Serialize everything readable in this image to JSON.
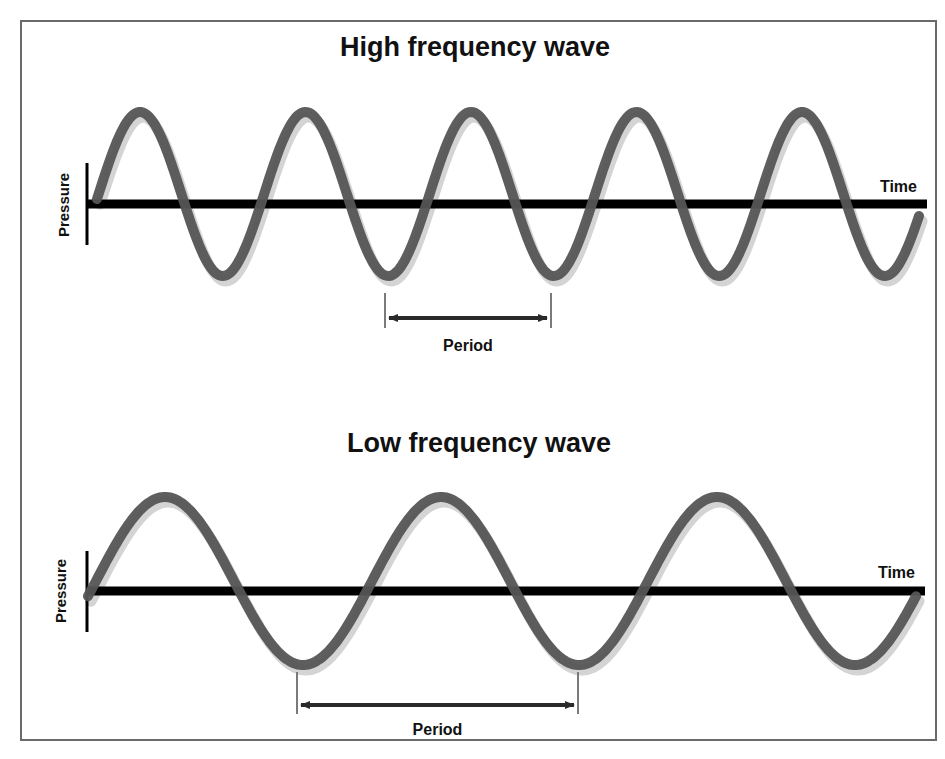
{
  "colors": {
    "wave": "#555555",
    "wave_shadow": "#cfcfcf",
    "axis": "#000000",
    "frame": "#6a6a6a",
    "marker": "#777777",
    "arrow": "#2a2a2a"
  },
  "panels": [
    {
      "title": "High frequency wave",
      "y_axis_label": "Pressure",
      "x_axis_label": "Time",
      "period_label": "Period",
      "cycles_shown": 5,
      "axis": {
        "x0": 86,
        "x1": 927,
        "y": 204,
        "vtick_top": 163,
        "vtick_bottom": 245
      },
      "wave": {
        "x_start": 97,
        "x_end": 920,
        "center": 194,
        "amplitude": 82,
        "period": 165.5,
        "first_peak_x": 140
      },
      "period_marker": {
        "x1": 385,
        "x2": 551,
        "tick_top": 293,
        "tick_bottom": 328,
        "arrow_y": 318,
        "label_y": 351
      }
    },
    {
      "title": "Low frequency wave",
      "y_axis_label": "Pressure",
      "x_axis_label": "Time",
      "period_label": "Period",
      "cycles_shown": 3,
      "axis": {
        "x0": 86,
        "x1": 925,
        "y": 591,
        "vtick_top": 551,
        "vtick_bottom": 632
      },
      "wave": {
        "x_start": 88,
        "x_end": 916,
        "center": 581,
        "amplitude": 84,
        "period": 276,
        "first_peak_x": 165
      },
      "period_marker": {
        "x1": 297,
        "x2": 578,
        "tick_top": 672,
        "tick_bottom": 714,
        "arrow_y": 705,
        "label_y": 735
      }
    }
  ]
}
